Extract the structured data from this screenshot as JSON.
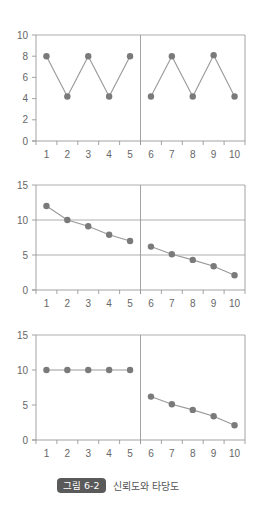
{
  "colors": {
    "axis": "#999999",
    "grid": "#999999",
    "line": "#999999",
    "marker": "#7a7a7a",
    "tick_text": "#666666",
    "badge_bg": "#5a5a5a",
    "badge_text": "#ffffff"
  },
  "caption": {
    "badge": "그림 6-2",
    "title": "신뢰도와 타당도"
  },
  "chart_data": [
    {
      "type": "line",
      "title": "",
      "xlabel": "",
      "ylabel": "",
      "x": [
        1,
        2,
        3,
        4,
        5,
        6,
        7,
        8,
        9,
        10
      ],
      "xticks": [
        "1",
        "2",
        "3",
        "4",
        "5",
        "6",
        "7",
        "8",
        "9",
        "10"
      ],
      "yticks": [
        0,
        2,
        4,
        6,
        8,
        10
      ],
      "ylim": [
        0,
        10
      ],
      "hgrid": [
        10
      ],
      "divider_after": 5,
      "segments": [
        {
          "x": [
            1,
            2,
            3,
            4,
            5
          ],
          "values": [
            8,
            4.2,
            8,
            4.2,
            8
          ]
        },
        {
          "x": [
            6,
            7,
            8,
            9,
            10
          ],
          "values": [
            4.2,
            8,
            4.2,
            8.1,
            4.2
          ]
        }
      ],
      "legend": null
    },
    {
      "type": "line",
      "title": "",
      "xlabel": "",
      "ylabel": "",
      "x": [
        1,
        2,
        3,
        4,
        5,
        6,
        7,
        8,
        9,
        10
      ],
      "xticks": [
        "1",
        "2",
        "3",
        "4",
        "5",
        "6",
        "7",
        "8",
        "9",
        "10"
      ],
      "yticks": [
        0,
        5,
        10,
        15
      ],
      "ylim": [
        0,
        15
      ],
      "hgrid": [
        5,
        10,
        15
      ],
      "divider_after": 5,
      "segments": [
        {
          "x": [
            1,
            2,
            3,
            4,
            5
          ],
          "values": [
            12,
            10,
            9.1,
            7.9,
            7
          ]
        },
        {
          "x": [
            6,
            7,
            8,
            9,
            10
          ],
          "values": [
            6.2,
            5.1,
            4.3,
            3.4,
            2.1
          ]
        }
      ],
      "legend": null
    },
    {
      "type": "line",
      "title": "",
      "xlabel": "",
      "ylabel": "",
      "x": [
        1,
        2,
        3,
        4,
        5,
        6,
        7,
        8,
        9,
        10
      ],
      "xticks": [
        "1",
        "2",
        "3",
        "4",
        "5",
        "6",
        "7",
        "8",
        "9",
        "10"
      ],
      "yticks": [
        0,
        5,
        10,
        15
      ],
      "ylim": [
        0,
        15
      ],
      "hgrid": [
        15
      ],
      "divider_after": 5,
      "segments": [
        {
          "x": [
            1,
            2,
            3,
            4,
            5
          ],
          "values": [
            10,
            10,
            10,
            10,
            10
          ]
        },
        {
          "x": [
            6,
            7,
            8,
            9,
            10
          ],
          "values": [
            6.2,
            5.1,
            4.3,
            3.4,
            2.1
          ]
        }
      ],
      "legend": null
    }
  ]
}
